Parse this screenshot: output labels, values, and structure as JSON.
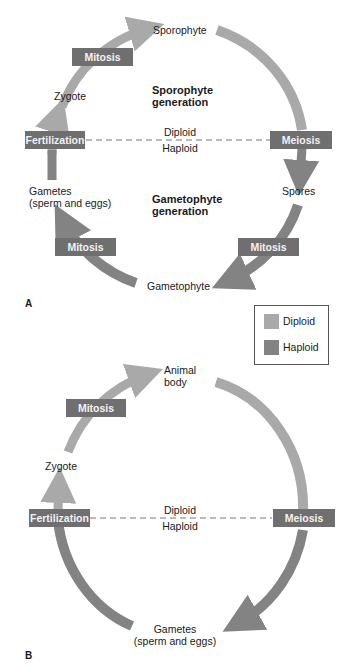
{
  "colors": {
    "diploid": "#a9a9a9",
    "haploid": "#838383",
    "label_box": "#6f6f6f",
    "label_text": "#f2f2f2"
  },
  "panel_a": {
    "label": "A",
    "nodes": {
      "sporophyte": "Sporophyte",
      "zygote": "Zygote",
      "gametes_line1": "Gametes",
      "gametes_line2": "(sperm and eggs)",
      "spores": "Spores",
      "gametophyte": "Gametophyte"
    },
    "boxes": {
      "mitosis_top": "Mitosis",
      "fertilization": "Fertilization",
      "meiosis": "Meiosis",
      "mitosis_left": "Mitosis",
      "mitosis_right": "Mitosis"
    },
    "generations": {
      "sporophyte_1": "Sporophyte",
      "sporophyte_2": "generation",
      "gametophyte_1": "Gametophyte",
      "gametophyte_2": "generation"
    },
    "divider": {
      "above": "Diploid",
      "below": "Haploid"
    }
  },
  "legend": {
    "items": [
      {
        "label": "Diploid"
      },
      {
        "label": "Haploid"
      }
    ]
  },
  "panel_b": {
    "label": "B",
    "nodes": {
      "animal_1": "Animal",
      "animal_2": "body",
      "zygote": "Zygote",
      "gametes_line1": "Gametes",
      "gametes_line2": "(sperm and eggs)"
    },
    "boxes": {
      "mitosis": "Mitosis",
      "fertilization": "Fertilization",
      "meiosis": "Meiosis"
    },
    "divider": {
      "above": "Diploid",
      "below": "Haploid"
    }
  }
}
